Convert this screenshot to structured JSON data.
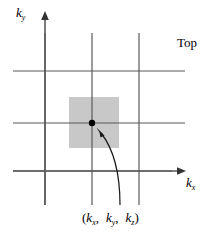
{
  "figure": {
    "title_label": "Top",
    "axes": {
      "x_label_symbol": "k",
      "x_label_subscript": "x",
      "y_label_symbol": "k",
      "y_label_subscript": "y"
    },
    "point_label": {
      "open_paren": "(",
      "close_paren": ")",
      "components": [
        {
          "symbol": "k",
          "subscript": "x",
          "separator": ","
        },
        {
          "symbol": "k",
          "subscript": "y",
          "separator": ","
        },
        {
          "symbol": "k",
          "subscript": "z",
          "separator": ""
        }
      ]
    },
    "colors": {
      "background": "#ffffff",
      "line": "#595959",
      "axis": "#595959",
      "cell_fill": "#c8c8c8",
      "point": "#000000",
      "arrow": "#1a1a1a",
      "text": "#000000"
    },
    "geometry": {
      "grid_vertical_x": [
        45,
        92,
        139
      ],
      "grid_horizontal_y": [
        71,
        123,
        171
      ],
      "grid_v_top": 33,
      "grid_v_bottom": 205,
      "grid_h_left": 13,
      "grid_h_right": 185,
      "cell_x": 69,
      "cell_y": 97,
      "cell_w": 50,
      "cell_h": 51,
      "point_x": 92,
      "point_y": 123,
      "point_r": 3.2,
      "y_axis_x": 45,
      "y_axis_top": 13,
      "x_axis_y": 171,
      "x_axis_right": 185
    }
  }
}
